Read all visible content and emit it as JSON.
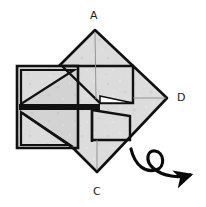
{
  "figure": {
    "name": "origami-fold-step",
    "caption": "",
    "background_color": "#ffffff"
  },
  "paper": {
    "fill_color": "#dcdcdc",
    "fill_color_shaded": "#d2d2d2",
    "outline_color": "#111111",
    "crease_color": "#8a8a8a",
    "outline_width": 2.6,
    "crease_width": 0.8
  },
  "labels": [
    {
      "id": "A",
      "text": "A",
      "position": "top",
      "x": 90,
      "y": 10
    },
    {
      "id": "C",
      "text": "C",
      "position": "bottom",
      "x": 93,
      "y": 186
    },
    {
      "id": "D",
      "text": "D",
      "position": "right",
      "x": 177,
      "y": 92
    }
  ],
  "geometry": {
    "diamond": {
      "name": "main-square-rotated",
      "vertices": {
        "A": [
          95,
          30
        ],
        "D": [
          167,
          98
        ],
        "C": [
          97,
          172
        ],
        "B": [
          25,
          100
        ]
      }
    },
    "left_flap": {
      "name": "left-folded-flap",
      "outline": [
        [
          17,
          66
        ],
        [
          78,
          66
        ],
        [
          78,
          148
        ],
        [
          17,
          148
        ]
      ]
    },
    "center_slit": {
      "name": "center-slit",
      "from": [
        97,
        98
      ],
      "to": [
        97,
        128
      ]
    }
  },
  "arrow": {
    "name": "turn-over-arrow",
    "type": "turn-over-loop",
    "color": "#0a0a0a",
    "stroke_width": 3.2,
    "loop_center": [
      156,
      160
    ],
    "loop_radius": 9,
    "tip": [
      193,
      177
    ]
  }
}
